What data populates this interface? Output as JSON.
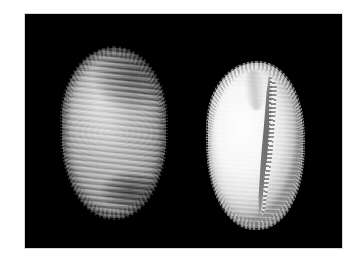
{
  "page": {
    "background_color": "#ffffff",
    "width": 351,
    "height": 261
  },
  "figure": {
    "name": "shell-specimen-plate",
    "background_color": "#000000",
    "border_color": "#d8d8d8",
    "caption": "",
    "bounds": {
      "x": 25,
      "y": 14,
      "width": 317,
      "height": 234
    }
  },
  "specimens": [
    {
      "id": "dorsal",
      "label": "",
      "view": "dorsal",
      "description": "Ribbed cowrie shell, dorsal view with transverse ribs and two dark blotches",
      "tone": "#a8a8a8",
      "dark_blotch_color": "#2a2a2a",
      "bounds": {
        "x": 62,
        "y": 48,
        "width": 104,
        "height": 170
      }
    },
    {
      "id": "ventral",
      "label": "",
      "view": "ventral",
      "description": "Ribbed cowrie shell, ventral view showing curved aperture with scalloped teeth",
      "tone": "#f6f6f6",
      "aperture_color": "#6e6e6e",
      "bounds": {
        "x": 208,
        "y": 63,
        "width": 95,
        "height": 165
      }
    }
  ]
}
